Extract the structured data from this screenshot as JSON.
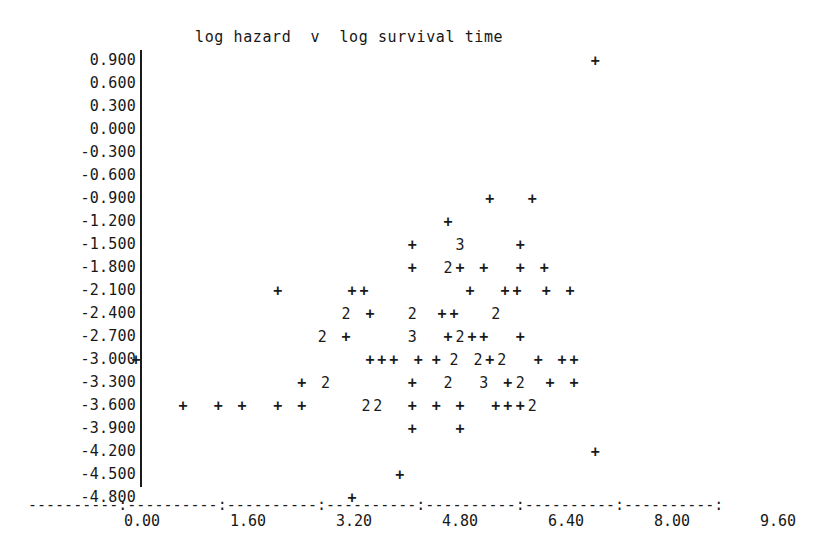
{
  "chart_data": {
    "type": "scatter",
    "title": "log hazard  v  log survival time",
    "xlabel": "log survival time",
    "ylabel": "log hazard",
    "xlim": [
      0.0,
      9.6
    ],
    "ylim": [
      -4.8,
      0.9
    ],
    "grid": false,
    "legend": null,
    "marker": "+",
    "overplot_notation": "Digits (2, 3) mark character cells holding that many coincident points; '+' marks a single point.",
    "x_ticks": [
      "0.00",
      "1.60",
      "3.20",
      "4.80",
      "6.40",
      "8.00",
      "9.60"
    ],
    "x_tick_values": [
      0.0,
      1.6,
      3.2,
      4.8,
      6.4,
      8.0,
      9.6
    ],
    "y_ticks": [
      "0.900",
      "0.600",
      "0.300",
      "0.000",
      "-0.300",
      "-0.600",
      "-0.900",
      "-1.200",
      "-1.500",
      "-1.800",
      "-2.100",
      "-2.400",
      "-2.700",
      "-3.000",
      "-3.300",
      "-3.600",
      "-3.900",
      "-4.200",
      "-4.500",
      "-4.800"
    ],
    "y_tick_values": [
      0.9,
      0.6,
      0.3,
      0.0,
      -0.3,
      -0.6,
      -0.9,
      -1.2,
      -1.5,
      -1.8,
      -2.1,
      -2.4,
      -2.7,
      -3.0,
      -3.3,
      -3.6,
      -3.9,
      -4.2,
      -4.5,
      -4.8
    ],
    "rows": [
      {
        "y": 0.9,
        "cells": [
          {
            "x": 6.84,
            "m": "+",
            "n": 1
          }
        ]
      },
      {
        "y": 0.6,
        "cells": []
      },
      {
        "y": 0.3,
        "cells": []
      },
      {
        "y": 0.0,
        "cells": []
      },
      {
        "y": -0.3,
        "cells": []
      },
      {
        "y": -0.6,
        "cells": []
      },
      {
        "y": -0.9,
        "cells": [
          {
            "x": 5.25,
            "m": "+",
            "n": 1
          },
          {
            "x": 5.89,
            "m": "+",
            "n": 1
          }
        ]
      },
      {
        "y": -1.2,
        "cells": [
          {
            "x": 4.62,
            "m": "+",
            "n": 1
          }
        ]
      },
      {
        "y": -1.5,
        "cells": [
          {
            "x": 4.08,
            "m": "+",
            "n": 1
          },
          {
            "x": 4.8,
            "m": "3",
            "n": 3
          },
          {
            "x": 5.71,
            "m": "+",
            "n": 1
          }
        ]
      },
      {
        "y": -1.8,
        "cells": [
          {
            "x": 4.08,
            "m": "+",
            "n": 1
          },
          {
            "x": 4.62,
            "m": "2",
            "n": 2
          },
          {
            "x": 4.8,
            "m": "+",
            "n": 1
          },
          {
            "x": 5.16,
            "m": "+",
            "n": 1
          },
          {
            "x": 5.71,
            "m": "+",
            "n": 1
          },
          {
            "x": 6.07,
            "m": "+",
            "n": 1
          }
        ]
      },
      {
        "y": -2.1,
        "cells": [
          {
            "x": 2.05,
            "m": "+",
            "n": 1
          },
          {
            "x": 3.17,
            "m": "+",
            "n": 1
          },
          {
            "x": 3.35,
            "m": "+",
            "n": 1
          },
          {
            "x": 4.95,
            "m": "+",
            "n": 1
          },
          {
            "x": 5.48,
            "m": "+",
            "n": 1
          },
          {
            "x": 5.66,
            "m": "+",
            "n": 1
          },
          {
            "x": 6.1,
            "m": "+",
            "n": 1
          },
          {
            "x": 6.46,
            "m": "+",
            "n": 1
          }
        ]
      },
      {
        "y": -2.4,
        "cells": [
          {
            "x": 3.08,
            "m": "2",
            "n": 2
          },
          {
            "x": 3.44,
            "m": "+",
            "n": 1
          },
          {
            "x": 4.08,
            "m": "2",
            "n": 2
          },
          {
            "x": 4.53,
            "m": "+",
            "n": 1
          },
          {
            "x": 4.71,
            "m": "+",
            "n": 1
          },
          {
            "x": 5.34,
            "m": "2",
            "n": 2
          }
        ]
      },
      {
        "y": -2.7,
        "cells": [
          {
            "x": 2.72,
            "m": "2",
            "n": 2
          },
          {
            "x": 3.08,
            "m": "+",
            "n": 1
          },
          {
            "x": 4.08,
            "m": "3",
            "n": 3
          },
          {
            "x": 4.62,
            "m": "+",
            "n": 1
          },
          {
            "x": 4.8,
            "m": "2",
            "n": 2
          },
          {
            "x": 4.98,
            "m": "+",
            "n": 1
          },
          {
            "x": 5.16,
            "m": "+",
            "n": 1
          },
          {
            "x": 5.71,
            "m": "+",
            "n": 1
          }
        ]
      },
      {
        "y": -3.0,
        "cells": [
          {
            "x": 0.0,
            "m": "+",
            "n": 1,
            "margin": true
          },
          {
            "x": 3.44,
            "m": "+",
            "n": 1
          },
          {
            "x": 3.62,
            "m": "+",
            "n": 1
          },
          {
            "x": 3.8,
            "m": "+",
            "n": 1
          },
          {
            "x": 4.17,
            "m": "+",
            "n": 1
          },
          {
            "x": 4.44,
            "m": "+",
            "n": 1
          },
          {
            "x": 4.71,
            "m": "2",
            "n": 2
          },
          {
            "x": 5.07,
            "m": "2",
            "n": 2
          },
          {
            "x": 5.25,
            "m": "+",
            "n": 1
          },
          {
            "x": 5.43,
            "m": "2",
            "n": 2
          },
          {
            "x": 5.98,
            "m": "+",
            "n": 1
          },
          {
            "x": 6.34,
            "m": "+",
            "n": 1
          },
          {
            "x": 6.52,
            "m": "+",
            "n": 1
          }
        ]
      },
      {
        "y": -3.3,
        "cells": [
          {
            "x": 2.41,
            "m": "+",
            "n": 1
          },
          {
            "x": 2.77,
            "m": "2",
            "n": 2
          },
          {
            "x": 4.08,
            "m": "+",
            "n": 1
          },
          {
            "x": 4.62,
            "m": "2",
            "n": 2
          },
          {
            "x": 5.16,
            "m": "3",
            "n": 3
          },
          {
            "x": 5.52,
            "m": "+",
            "n": 1
          },
          {
            "x": 5.71,
            "m": "2",
            "n": 2
          },
          {
            "x": 6.16,
            "m": "+",
            "n": 1
          },
          {
            "x": 6.52,
            "m": "+",
            "n": 1
          }
        ]
      },
      {
        "y": -3.6,
        "cells": [
          {
            "x": 0.62,
            "m": "+",
            "n": 1
          },
          {
            "x": 1.15,
            "m": "+",
            "n": 1
          },
          {
            "x": 1.51,
            "m": "+",
            "n": 1
          },
          {
            "x": 2.05,
            "m": "+",
            "n": 1
          },
          {
            "x": 2.41,
            "m": "+",
            "n": 1
          },
          {
            "x": 3.38,
            "m": "2",
            "n": 2
          },
          {
            "x": 3.56,
            "m": "2",
            "n": 2
          },
          {
            "x": 4.08,
            "m": "+",
            "n": 1
          },
          {
            "x": 4.44,
            "m": "+",
            "n": 1
          },
          {
            "x": 4.8,
            "m": "+",
            "n": 1
          },
          {
            "x": 5.34,
            "m": "+",
            "n": 1
          },
          {
            "x": 5.52,
            "m": "+",
            "n": 1
          },
          {
            "x": 5.71,
            "m": "+",
            "n": 1
          },
          {
            "x": 5.89,
            "m": "2",
            "n": 2
          }
        ]
      },
      {
        "y": -3.9,
        "cells": [
          {
            "x": 4.08,
            "m": "+",
            "n": 1
          },
          {
            "x": 4.8,
            "m": "+",
            "n": 1
          }
        ]
      },
      {
        "y": -4.2,
        "cells": [
          {
            "x": 6.84,
            "m": "+",
            "n": 1
          }
        ]
      },
      {
        "y": -4.5,
        "cells": [
          {
            "x": 3.89,
            "m": "+",
            "n": 1
          }
        ]
      },
      {
        "y": -4.8,
        "cells": [
          {
            "x": 3.17,
            "m": "+",
            "n": 1
          }
        ]
      }
    ],
    "axis_rule": "----------:----------:----------:----------:----------:----------:----------:"
  }
}
